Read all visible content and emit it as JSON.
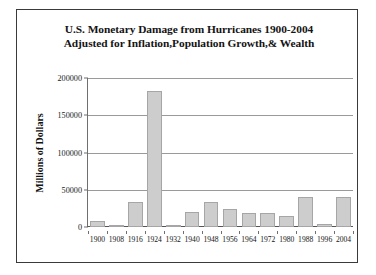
{
  "chart_data": {
    "type": "bar",
    "title": "U.S. Monetary Damage from Hurricanes 1900-2004 Adjusted for Inflation,Population Growth,& Wealth",
    "title_lines": [
      "U.S. Monetary Damage from Hurricanes 1900-2004",
      "Adjusted for Inflation,Population Growth,& Wealth"
    ],
    "xlabel": "",
    "ylabel": "Millions of Dollars",
    "categories": [
      "1900",
      "1908",
      "1916",
      "1924",
      "1932",
      "1940",
      "1948",
      "1956",
      "1964",
      "1972",
      "1980",
      "1988",
      "1996",
      "2004"
    ],
    "values": [
      8500,
      3000,
      34000,
      183000,
      2500,
      20000,
      33000,
      24000,
      19000,
      19000,
      15000,
      40000,
      4000,
      40000
    ],
    "ylim": [
      0,
      200000
    ],
    "ytick_labels": [
      "0",
      "50000",
      "100000",
      "150000",
      "200000"
    ],
    "ytick_values": [
      0,
      50000,
      100000,
      150000,
      200000
    ],
    "grid": true,
    "legend": null,
    "bar_color": "#cdcdcd",
    "bar_border_color": "#a6a6a6",
    "gridline_color": "#9a9a9a",
    "axis_color": "#6f6f6f",
    "background": "#ffffff",
    "border_color": "#3a3a3a",
    "text_color": "#141414"
  }
}
